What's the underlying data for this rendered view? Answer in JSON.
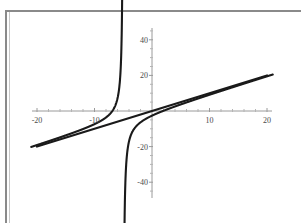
{
  "figure": {
    "background_color": "#ffffff",
    "frame_color": "#8a8a8a",
    "axis_color": "#9a9a9a",
    "curve_color": "#1a1a1a"
  },
  "chart_data": {
    "type": "line",
    "title": "",
    "subtitle": "",
    "xlabel": "",
    "ylabel": "",
    "grid": false,
    "legend": null,
    "xlim": [
      -21.5,
      21.5
    ],
    "ylim": [
      -48,
      49
    ],
    "xticks": [
      -20,
      -10,
      10,
      20
    ],
    "xtick_labels": [
      "-20",
      "-10",
      "10",
      "20"
    ],
    "yticks": [
      40,
      20,
      -20,
      -40
    ],
    "ytick_labels": [
      "40",
      "20",
      "-20",
      "-40"
    ],
    "xminor_step": 2,
    "yminor_step": 5,
    "axes_cross_at": [
      0,
      0
    ],
    "annotations": [],
    "vertical_asymptote": -5,
    "oblique_asymptote": {
      "slope": 1,
      "intercept": 0
    },
    "series": [
      {
        "name": "oblique-asymptote-line",
        "type": "line",
        "x": [
          -20,
          -10,
          0,
          10,
          20
        ],
        "values": [
          -20,
          -10,
          0,
          10,
          20
        ]
      },
      {
        "name": "rational-branch-left",
        "type": "line",
        "x": [
          -5.35,
          -5.4,
          -5.5,
          -5.7,
          -6.0,
          -6.5,
          -7.0,
          -8.0,
          -9.0,
          -10.0,
          -12.0,
          -14.0,
          -16.0,
          -18.0,
          -20.0
        ],
        "values": [
          47.0,
          30.0,
          19.5,
          13.0,
          9.0,
          6.3,
          5.1,
          4.0,
          3.4,
          3.0,
          2.5,
          2.2,
          2.0,
          1.8,
          1.7
        ]
      },
      {
        "name": "rational-branch-right",
        "type": "line",
        "x": [
          -4.65,
          -4.6,
          -4.5,
          -4.3,
          -4.0,
          -3.5,
          -3.0,
          -2.0,
          -1.0,
          0.0,
          2.0,
          5.0,
          10.0,
          15.0,
          20.0
        ],
        "values": [
          -47.0,
          -30.0,
          -19.5,
          -13.0,
          -9.0,
          -6.3,
          -5.1,
          -4.0,
          -3.4,
          -3.0,
          -2.5,
          -2.2,
          -2.0,
          -1.8,
          -1.7
        ]
      }
    ]
  },
  "axis_labels": {
    "x": [
      {
        "text": "-20",
        "value": -20
      },
      {
        "text": "-10",
        "value": -10
      },
      {
        "text": "10",
        "value": 10
      },
      {
        "text": "20",
        "value": 20
      }
    ],
    "y": [
      {
        "text": "40",
        "value": 40
      },
      {
        "text": "20",
        "value": 20
      },
      {
        "text": "-20",
        "value": -20
      },
      {
        "text": "-40",
        "value": -40
      }
    ]
  }
}
